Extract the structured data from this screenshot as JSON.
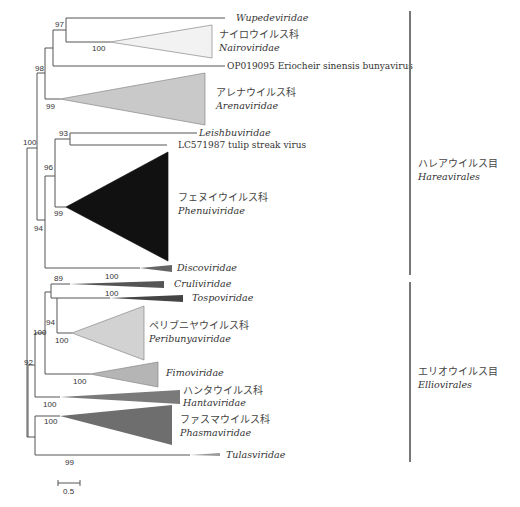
{
  "tree": {
    "clades": {
      "wupedeviridae": {
        "latin": "Wupedeviridae"
      },
      "nairoviridae": {
        "jp": "ナイロウイルス科",
        "latin": "Nairoviridae",
        "fill": "#f2f2f2"
      },
      "op019095": {
        "label": "OP019095 Eriocheir sinensis bunyavirus"
      },
      "arenaviridae": {
        "jp": "アレナウイルス科",
        "latin": "Arenaviridae",
        "fill": "#c9c9c9"
      },
      "leishbuviridae": {
        "latin": "Leishbuviridae"
      },
      "lc571987": {
        "label": "LC571987 tulip streak virus"
      },
      "phenuiviridae": {
        "jp": "フェヌイウイルス科",
        "latin": "Phenuiviridae",
        "fill": "#111111"
      },
      "discoviridae": {
        "latin": "Discoviridae",
        "fill": "#666666"
      },
      "cruliviridae": {
        "latin": "Cruliviridae",
        "fill": "#555555"
      },
      "tospoviridae": {
        "latin": "Tospoviridae",
        "fill": "#444444"
      },
      "peribunyaviridae": {
        "jp": "ペリブニヤウイルス科",
        "latin": "Peribunyaviridae",
        "fill": "#d2d2d2"
      },
      "fimoviridae": {
        "latin": "Fimoviridae",
        "fill": "#b5b5b5"
      },
      "hantaviridae": {
        "jp": "ハンタウイルス科",
        "latin": "Hantaviridae",
        "fill": "#7a7a7a"
      },
      "phasmaviridae": {
        "jp": "ファスマウイルス科",
        "latin": "Phasmaviridae",
        "fill": "#6e6e6e"
      },
      "tulasviridae": {
        "latin": "Tulasviridae",
        "fill": "#9a9a9a"
      }
    },
    "support": {
      "n97": "97",
      "n100_nairo": "100",
      "n98": "98",
      "n99_arena": "99",
      "n100_root": "100",
      "n93": "93",
      "n96": "96",
      "n99_phenui": "99",
      "n94_hare": "94",
      "n100_disco": "100",
      "n89": "89",
      "n100_cruli": "100",
      "n100_tospo": "100",
      "n94_ellio": "94",
      "n100_peri": "100",
      "n100_ellio": "100",
      "n100_fimo": "100",
      "n92": "92",
      "n100_hanta": "100",
      "n100_phasma": "100",
      "n99_tulas": "99"
    },
    "orders": [
      {
        "jp": "ハレアウイルス目",
        "latin": "Hareavirales"
      },
      {
        "jp": "エリオウイルス目",
        "latin": "Elliovirales"
      }
    ],
    "scale_bar": {
      "label": "0.5"
    }
  }
}
